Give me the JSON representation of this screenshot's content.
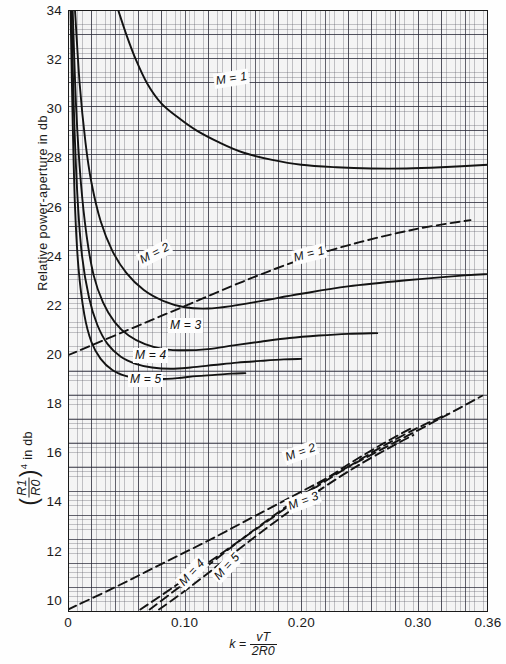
{
  "chart_data": {
    "type": "line",
    "title": "",
    "xlabel": "k = vT / 2R0",
    "ylabel_upper": "Relative power-aperture in db",
    "ylabel_lower": "(R1/R0)^4 in db",
    "xlim": [
      0,
      0.36
    ],
    "ylim": [
      9.5,
      34
    ],
    "grid": true,
    "legend": "inline-curve-labels",
    "xticks": [
      "0",
      "0.10",
      "0.20",
      "0.30",
      "0.36"
    ],
    "xtick_values": [
      0,
      0.1,
      0.2,
      0.3,
      0.36
    ],
    "yticks": [
      "10",
      "12",
      "14",
      "16",
      "18",
      "20",
      "22",
      "24",
      "26",
      "28",
      "30",
      "32",
      "34"
    ],
    "ytick_values": [
      10,
      12,
      14,
      16,
      18,
      20,
      22,
      24,
      26,
      28,
      30,
      32,
      34
    ],
    "series": [
      {
        "name": "M = 1",
        "style": "solid",
        "label": "M = 1",
        "points": [
          [
            0.043,
            34.0
          ],
          [
            0.05,
            33.0
          ],
          [
            0.058,
            32.0
          ],
          [
            0.068,
            31.0
          ],
          [
            0.08,
            30.2
          ],
          [
            0.095,
            29.6
          ],
          [
            0.11,
            29.1
          ],
          [
            0.13,
            28.6
          ],
          [
            0.15,
            28.2
          ],
          [
            0.175,
            27.9
          ],
          [
            0.2,
            27.7
          ],
          [
            0.23,
            27.6
          ],
          [
            0.26,
            27.55
          ],
          [
            0.29,
            27.55
          ],
          [
            0.32,
            27.6
          ],
          [
            0.36,
            27.7
          ]
        ]
      },
      {
        "name": "M = 2",
        "style": "solid",
        "label": "M = 2",
        "points": [
          [
            0.006,
            34.0
          ],
          [
            0.01,
            31.0
          ],
          [
            0.015,
            28.6
          ],
          [
            0.02,
            27.0
          ],
          [
            0.028,
            25.4
          ],
          [
            0.038,
            24.2
          ],
          [
            0.05,
            23.3
          ],
          [
            0.065,
            22.6
          ],
          [
            0.082,
            22.15
          ],
          [
            0.1,
            21.9
          ],
          [
            0.12,
            21.85
          ],
          [
            0.14,
            21.95
          ],
          [
            0.165,
            22.15
          ],
          [
            0.2,
            22.45
          ],
          [
            0.24,
            22.75
          ],
          [
            0.29,
            23.0
          ],
          [
            0.34,
            23.2
          ],
          [
            0.36,
            23.25
          ]
        ]
      },
      {
        "name": "M = 3",
        "style": "solid",
        "label": "M = 3",
        "points": [
          [
            0.004,
            34.0
          ],
          [
            0.007,
            30.0
          ],
          [
            0.011,
            27.0
          ],
          [
            0.016,
            24.8
          ],
          [
            0.022,
            23.2
          ],
          [
            0.03,
            22.1
          ],
          [
            0.04,
            21.3
          ],
          [
            0.052,
            20.75
          ],
          [
            0.066,
            20.4
          ],
          [
            0.082,
            20.2
          ],
          [
            0.1,
            20.15
          ],
          [
            0.12,
            20.2
          ],
          [
            0.142,
            20.35
          ],
          [
            0.165,
            20.5
          ],
          [
            0.19,
            20.65
          ],
          [
            0.215,
            20.75
          ],
          [
            0.24,
            20.82
          ],
          [
            0.265,
            20.85
          ]
        ]
      },
      {
        "name": "M = 4",
        "style": "solid",
        "label": "M = 4",
        "points": [
          [
            0.003,
            34.0
          ],
          [
            0.005,
            30.0
          ],
          [
            0.008,
            26.5
          ],
          [
            0.012,
            24.0
          ],
          [
            0.018,
            22.3
          ],
          [
            0.025,
            21.2
          ],
          [
            0.034,
            20.4
          ],
          [
            0.045,
            19.9
          ],
          [
            0.058,
            19.6
          ],
          [
            0.072,
            19.45
          ],
          [
            0.088,
            19.4
          ],
          [
            0.105,
            19.45
          ],
          [
            0.125,
            19.55
          ],
          [
            0.145,
            19.65
          ],
          [
            0.165,
            19.72
          ],
          [
            0.185,
            19.78
          ],
          [
            0.2,
            19.8
          ]
        ]
      },
      {
        "name": "M = 5",
        "style": "solid",
        "label": "M = 5",
        "points": [
          [
            0.0022,
            34.0
          ],
          [
            0.004,
            29.5
          ],
          [
            0.006,
            26.0
          ],
          [
            0.009,
            23.5
          ],
          [
            0.014,
            21.6
          ],
          [
            0.02,
            20.5
          ],
          [
            0.028,
            19.8
          ],
          [
            0.038,
            19.35
          ],
          [
            0.05,
            19.1
          ],
          [
            0.063,
            19.0
          ],
          [
            0.078,
            18.98
          ],
          [
            0.094,
            19.02
          ],
          [
            0.11,
            19.1
          ],
          [
            0.126,
            19.15
          ],
          [
            0.14,
            19.2
          ],
          [
            0.152,
            19.22
          ]
        ]
      },
      {
        "name": "M = 1 (dashed)",
        "style": "dashed",
        "label": "M = 1",
        "points": [
          [
            0.0,
            19.95
          ],
          [
            0.05,
            20.95
          ],
          [
            0.1,
            21.95
          ],
          [
            0.15,
            22.95
          ],
          [
            0.2,
            23.85
          ],
          [
            0.25,
            24.55
          ],
          [
            0.3,
            25.1
          ],
          [
            0.345,
            25.45
          ]
        ]
      },
      {
        "name": "M = 2 (dashed)",
        "style": "dashed",
        "label": "M = 2",
        "points": [
          [
            0.0,
            9.6
          ],
          [
            0.04,
            10.5
          ],
          [
            0.08,
            11.45
          ],
          [
            0.12,
            12.4
          ],
          [
            0.16,
            13.4
          ],
          [
            0.2,
            14.4
          ],
          [
            0.24,
            15.4
          ],
          [
            0.28,
            16.4
          ],
          [
            0.32,
            17.4
          ],
          [
            0.355,
            18.3
          ]
        ]
      },
      {
        "name": "M = 3 (dashed)",
        "style": "dashed",
        "label": "M = 3",
        "points": [
          [
            0.062,
            9.6
          ],
          [
            0.09,
            10.5
          ],
          [
            0.12,
            11.5
          ],
          [
            0.15,
            12.5
          ],
          [
            0.18,
            13.5
          ],
          [
            0.21,
            14.5
          ],
          [
            0.24,
            15.4
          ],
          [
            0.27,
            16.25
          ],
          [
            0.3,
            17.0
          ],
          [
            0.325,
            17.55
          ]
        ]
      },
      {
        "name": "M = 4 (dashed)",
        "style": "dashed",
        "label": "M = 4",
        "points": [
          [
            0.07,
            9.6
          ],
          [
            0.095,
            10.5
          ],
          [
            0.12,
            11.4
          ],
          [
            0.15,
            12.5
          ],
          [
            0.18,
            13.55
          ],
          [
            0.21,
            14.55
          ],
          [
            0.24,
            15.5
          ],
          [
            0.27,
            16.35
          ],
          [
            0.295,
            17.0
          ]
        ]
      },
      {
        "name": "M = 5 (dashed)",
        "style": "dashed",
        "label": "M = 5",
        "points": [
          [
            0.078,
            9.6
          ],
          [
            0.1,
            10.35
          ],
          [
            0.13,
            11.45
          ],
          [
            0.16,
            12.55
          ],
          [
            0.19,
            13.6
          ],
          [
            0.22,
            14.6
          ],
          [
            0.25,
            15.5
          ],
          [
            0.28,
            16.3
          ],
          [
            0.296,
            16.7
          ]
        ]
      }
    ],
    "curve_labels": [
      {
        "text": "M = 1",
        "x": 214,
        "y": 74,
        "rot": -9,
        "name": "curve-label-solid-m1"
      },
      {
        "text": "M = 2",
        "x": 139,
        "y": 254,
        "rot": -27,
        "name": "curve-label-solid-m2"
      },
      {
        "text": "M = 3",
        "x": 168,
        "y": 318,
        "rot": 0,
        "name": "curve-label-solid-m3"
      },
      {
        "text": "M = 4",
        "x": 133,
        "y": 348,
        "rot": 0,
        "name": "curve-label-solid-m4"
      },
      {
        "text": "M = 5",
        "x": 128,
        "y": 372,
        "rot": 0,
        "name": "curve-label-solid-m5"
      },
      {
        "text": "M = 1",
        "x": 292,
        "y": 251,
        "rot": -14,
        "name": "curve-label-dashed-m1"
      },
      {
        "text": "M = 2",
        "x": 284,
        "y": 451,
        "rot": -20,
        "name": "curve-label-dashed-m2"
      },
      {
        "text": "M = 3",
        "x": 287,
        "y": 500,
        "rot": -21,
        "name": "curve-label-dashed-m3"
      },
      {
        "text": "M = 4",
        "x": 180,
        "y": 578,
        "rot": -47,
        "name": "curve-label-dashed-m4"
      },
      {
        "text": "M = 5",
        "x": 215,
        "y": 572,
        "rot": -47,
        "name": "curve-label-dashed-m5"
      }
    ],
    "axis_label_parts": {
      "y_upper": "Relative power-aperture in db",
      "y_lower_prefix": "(",
      "y_lower_num": "R1",
      "y_lower_den": "R0",
      "y_lower_suffix": ")",
      "y_lower_exp": "4",
      "y_lower_tail": "in db",
      "x_k": "k",
      "x_eq": "=",
      "x_num": "vT",
      "x_den": "2R0"
    }
  },
  "colors": {
    "curve": "#131313",
    "grid_minor": "#9a9aa6",
    "grid_major": "#3a3a4a",
    "axis": "#1a1a1a",
    "background": "#f4f4f4"
  }
}
